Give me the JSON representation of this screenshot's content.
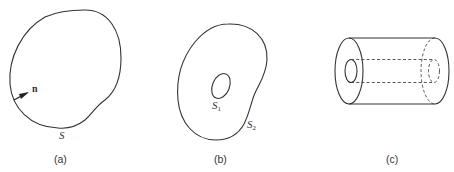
{
  "figure": {
    "panels": [
      {
        "id": "a",
        "caption": "(a)",
        "surface_label": "S",
        "normal_label": "n",
        "description": "Closed surface S with outward normal vector n"
      },
      {
        "id": "b",
        "caption": "(b)",
        "inner_surface_label": "S",
        "inner_surface_sub": "1",
        "outer_surface_label": "S",
        "outer_surface_sub": "2",
        "description": "Region bounded by inner surface S1 and outer surface S2"
      },
      {
        "id": "c",
        "caption": "(c)",
        "description": "Hollow cylinder (cylindrical shell) with hidden edges dashed"
      }
    ],
    "colors": {
      "stroke": "#333333",
      "background": "#ffffff"
    }
  }
}
